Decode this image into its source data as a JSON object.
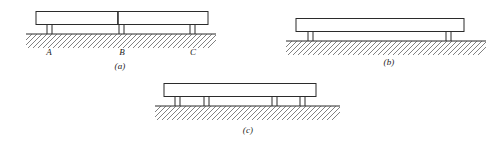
{
  "figure": {
    "type": "engineering-diagram",
    "panels": [
      {
        "id": "a",
        "caption": "(a)",
        "beam_segments": 2,
        "support_count": 3,
        "supports": [
          {
            "label": "A",
            "legs": 2
          },
          {
            "label": "B",
            "legs": 2
          },
          {
            "label": "C",
            "legs": 2
          }
        ],
        "ground": "hatched"
      },
      {
        "id": "b",
        "caption": "(b)",
        "beam_segments": 1,
        "support_count": 2,
        "supports": [
          {
            "label": "",
            "legs": 2
          },
          {
            "label": "",
            "legs": 2
          }
        ],
        "ground": "hatched"
      },
      {
        "id": "c",
        "caption": "(c)",
        "beam_segments": 1,
        "support_count": 4,
        "supports": [
          {
            "label": "",
            "legs": 2
          },
          {
            "label": "",
            "legs": 2
          },
          {
            "label": "",
            "legs": 2
          },
          {
            "label": "",
            "legs": 2
          }
        ],
        "ground": "hatched"
      }
    ],
    "labels": {
      "a_support_1": "A",
      "a_support_2": "B",
      "a_support_3": "C",
      "caption_a": "(a)",
      "caption_b": "(b)",
      "caption_c": "(c)"
    },
    "colors": {
      "line": "#2b2b2b",
      "hatch": "#4a4a4a",
      "beam_fill": "#ffffff",
      "background": "#ffffff"
    }
  }
}
